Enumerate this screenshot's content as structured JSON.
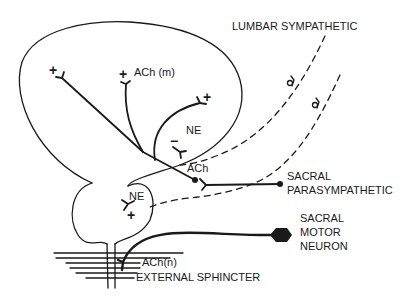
{
  "diagram": {
    "labels": {
      "lumbar_sympathetic": "LUMBAR SYMPATHETIC",
      "ach_m": "ACh (m)",
      "ne_upper": "NE",
      "ach": "ACh",
      "sacral_parasympathetic_line1": "SACRAL",
      "sacral_parasympathetic_line2": "PARASYMPATHETIC",
      "ne_lower": "NE",
      "sacral_motor_line1": "SACRAL",
      "sacral_motor_line2": "MOTOR",
      "sacral_motor_line3": "NEURON",
      "ach_n": "ACh(n)",
      "external_sphincter": "EXTERNAL SPHINCTER"
    },
    "symbols": {
      "plus": "+",
      "minus": "−"
    },
    "pathways": [
      {
        "name": "lumbar sympathetic",
        "style": "dashed",
        "transmitter": "NE"
      },
      {
        "name": "sacral parasympathetic",
        "style": "solid",
        "transmitter": "ACh"
      },
      {
        "name": "sacral motor neuron",
        "style": "solid-thick",
        "transmitter": "ACh(n)"
      }
    ],
    "colors": {
      "ink": "#1a1a1a",
      "background": "#ffffff"
    }
  }
}
